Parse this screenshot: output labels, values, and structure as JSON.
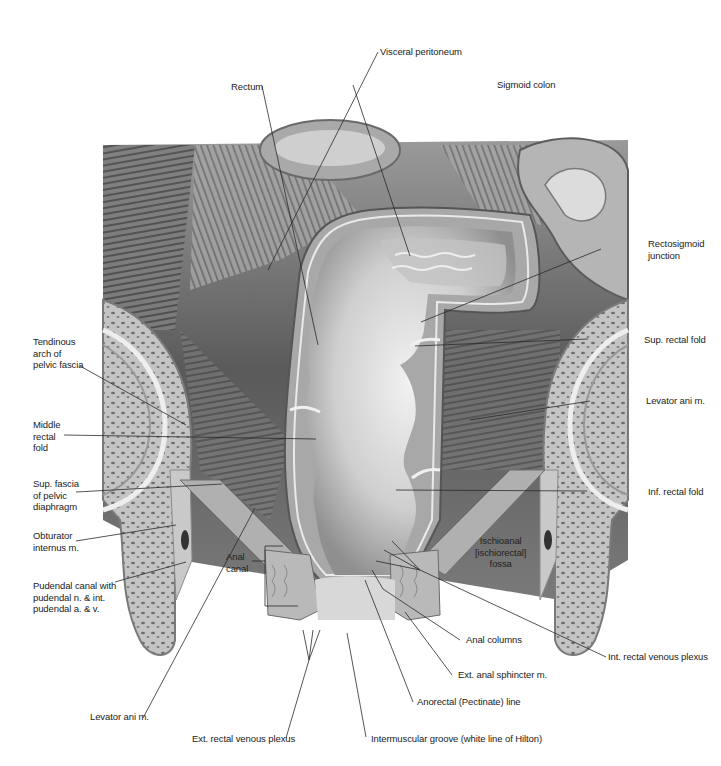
{
  "figure": {
    "colors": {
      "background": "#ffffff",
      "text": "#222222",
      "leader": "#2a2a2a",
      "tissue_dark": "#4a4a4a",
      "tissue_mid": "#8a8a8a",
      "tissue_light": "#c8c8c8",
      "mucosa": "#d9d9d9",
      "bone": "#bdbdbd"
    }
  },
  "labels": {
    "visceral_peritoneum": "Visceral peritoneum",
    "rectum": "Rectum",
    "sigmoid_colon": "Sigmoid colon",
    "rectosigmoid_junction": "Rectosigmoid\njunction",
    "tendinous_arch": "Tendinous\narch of\npelvic fascia",
    "sup_rectal_fold": "Sup. rectal fold",
    "middle_rectal_fold": "Middle\nrectal\nfold",
    "levator_ani_right": "Levator ani m.",
    "sup_fascia": "Sup. fascia\nof pelvic\ndiaphragm",
    "inf_rectal_fold": "Inf. rectal fold",
    "obturator_internus": "Obturator\ninternus m.",
    "ischioanal_fossa": "Ischioanal\n[ischiorectal]\nfossa",
    "pudendal_canal": "Pudendal canal with\npudendal n. & int.\npudendal a. & v.",
    "anal_canal": "Anal\ncanal",
    "anal_columns": "Anal columns",
    "int_rectal_venous_plexus": "Int. rectal venous plexus",
    "ext_anal_sphincter": "Ext. anal sphincter m.",
    "levator_ani_left": "Levator ani m.",
    "anorectal_line": "Anorectal (Pectinate) line",
    "ext_rectal_venous_plexus": "Ext. rectal venous plexus",
    "intermuscular_groove": "Intermuscular groove (white line of Hilton)"
  }
}
